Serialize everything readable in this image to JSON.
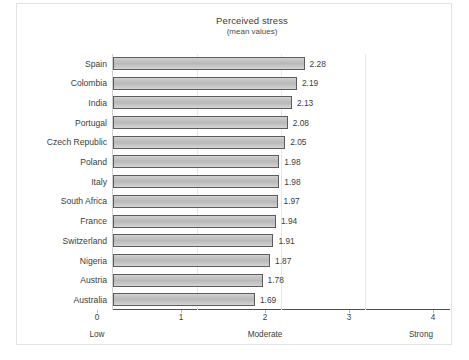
{
  "chart_data": {
    "type": "bar",
    "orientation": "horizontal",
    "title": "Perceived stress",
    "subtitle": "(mean values)",
    "xlabel": "",
    "ylabel": "",
    "xlim": [
      0,
      4
    ],
    "xticks": [
      "0",
      "1",
      "2",
      "3",
      "4"
    ],
    "grid": true,
    "legend": null,
    "zone_labels": [
      {
        "text": "Low",
        "value": 0,
        "align": "center"
      },
      {
        "text": "Moderate",
        "value": 2,
        "align": "center"
      },
      {
        "text": "Strong",
        "value": 4,
        "align": "right"
      }
    ],
    "categories": [
      "Spain",
      "Colombia",
      "India",
      "Portugal",
      "Czech Republic",
      "Poland",
      "Italy",
      "South Africa",
      "France",
      "Switzerland",
      "Nigeria",
      "Austria",
      "Australia"
    ],
    "values": [
      2.28,
      2.19,
      2.13,
      2.08,
      2.05,
      1.98,
      1.98,
      1.97,
      1.94,
      1.91,
      1.87,
      1.78,
      1.69
    ],
    "value_labels": [
      "2.28",
      "2.19",
      "2.13",
      "2.08",
      "2.05",
      "1.98",
      "1.98",
      "1.97",
      "1.94",
      "1.91",
      "1.87",
      "1.78",
      "1.69"
    ],
    "colors": {
      "bar_fill": "#c6c6c6",
      "bar_border": "#5c5c5c",
      "axis": "#4f4f4f",
      "grid": "#e8e8e8",
      "text": "#3d3d3d",
      "frame": "#e3e3e3",
      "background": "#ffffff"
    }
  }
}
